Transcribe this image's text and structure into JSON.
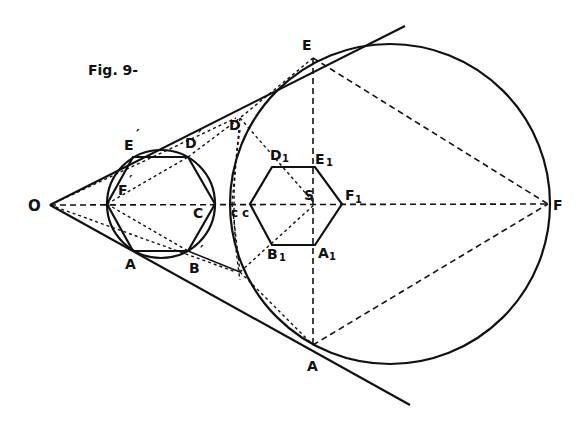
{
  "figure": {
    "title": "Fig. 9-"
  },
  "labels": {
    "O": "O",
    "E_prime": "E",
    "D_prime": "D",
    "F_prime": "F",
    "C_prime": "C",
    "A_prime": "A",
    "B_prime": "B",
    "prime_mark": "′",
    "c_small": "c",
    "c1": "c",
    "D": "D",
    "E": "E",
    "F": "F",
    "A": "A",
    "S": "S",
    "D1": "D",
    "E1": "E",
    "F1": "F",
    "A1": "A",
    "B1": "B",
    "sub1": "1"
  },
  "geometry": {
    "apex_O": [
      50,
      205
    ],
    "small_circle": {
      "cx": 161,
      "cy": 204,
      "r": 54
    },
    "large_circle": {
      "cx": 390,
      "cy": 204,
      "r": 160
    },
    "small_hexagon": [
      [
        133,
        157
      ],
      [
        188,
        157
      ],
      [
        215,
        204
      ],
      [
        188,
        251
      ],
      [
        133,
        251
      ],
      [
        107,
        204
      ]
    ],
    "inner_hexagon": [
      [
        272,
        167
      ],
      [
        315,
        167
      ],
      [
        342,
        204
      ],
      [
        315,
        245
      ],
      [
        272,
        245
      ],
      [
        250,
        204
      ]
    ],
    "tangent_upper": [
      [
        50,
        205
      ],
      [
        405,
        26
      ]
    ],
    "tangent_lower": [
      [
        50,
        205
      ],
      [
        410,
        405
      ]
    ]
  }
}
